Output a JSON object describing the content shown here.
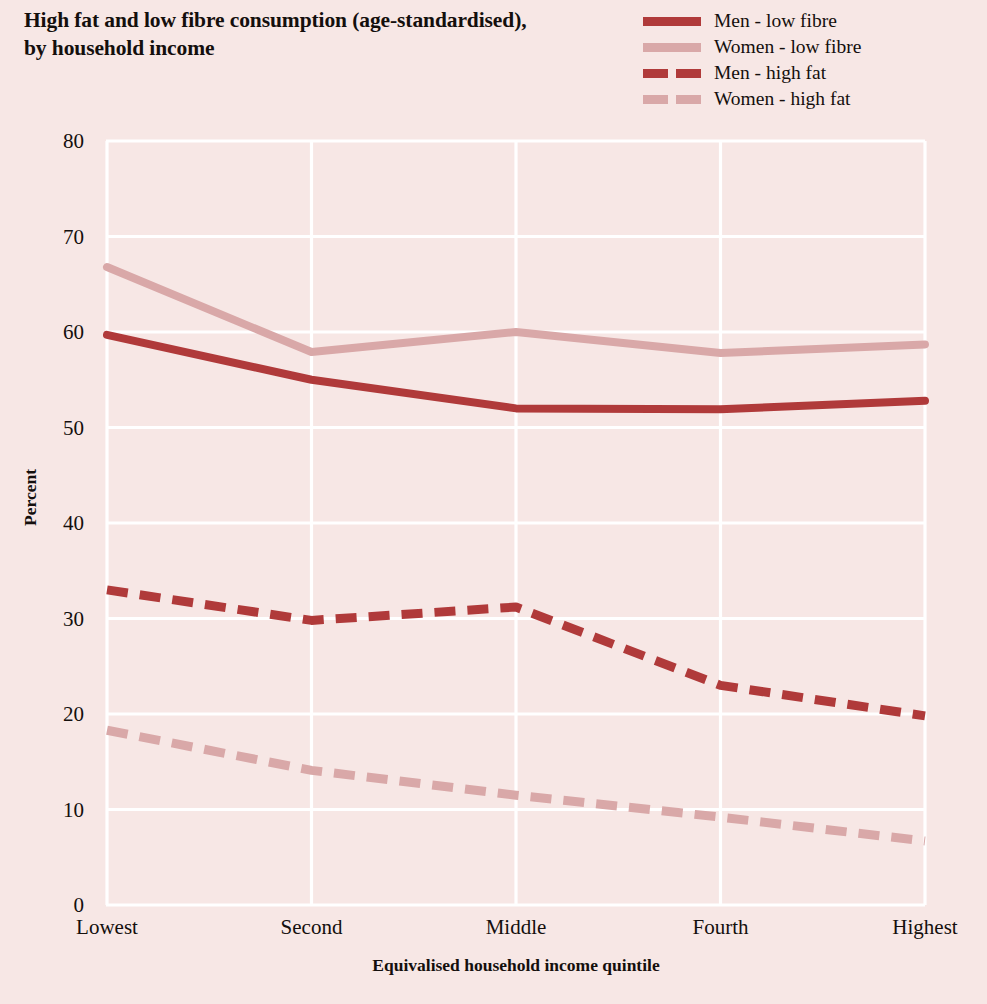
{
  "title": "High fat and low fibre consumption (age-standardised),\nby household income",
  "colors": {
    "background": "#f7e7e5",
    "grid": "#ffffff",
    "men": "#b03a3a",
    "women": "#d9a8a8",
    "text": "#140f0d"
  },
  "legend": {
    "position": "top-right",
    "items": [
      {
        "label": "Men - low fibre",
        "color": "#b03a3a",
        "style": "solid"
      },
      {
        "label": "Women - low fibre",
        "color": "#d9a8a8",
        "style": "solid"
      },
      {
        "label": "Men - high fat",
        "color": "#b03a3a",
        "style": "dashed"
      },
      {
        "label": "Women - high fat",
        "color": "#d9a8a8",
        "style": "dashed"
      }
    ]
  },
  "chart_data": {
    "type": "line",
    "title": "High fat and low fibre consumption (age-standardised), by household income",
    "xlabel": "Equivalised household income quintile",
    "ylabel": "Percent",
    "categories": [
      "Lowest",
      "Second",
      "Middle",
      "Fourth",
      "Highest"
    ],
    "ylim": [
      0,
      80
    ],
    "yticks": [
      0,
      10,
      20,
      30,
      40,
      50,
      60,
      70,
      80
    ],
    "grid": true,
    "series": [
      {
        "name": "Men - low fibre",
        "color": "#b03a3a",
        "style": "solid",
        "values": [
          59.7,
          55.0,
          52.0,
          51.9,
          52.8
        ]
      },
      {
        "name": "Women - low fibre",
        "color": "#d9a8a8",
        "style": "solid",
        "values": [
          66.8,
          57.9,
          60.0,
          57.8,
          58.7
        ]
      },
      {
        "name": "Men - high fat",
        "color": "#b03a3a",
        "style": "dashed",
        "values": [
          33.0,
          29.8,
          31.2,
          23.0,
          19.8
        ]
      },
      {
        "name": "Women - high fat",
        "color": "#d9a8a8",
        "style": "dashed",
        "values": [
          18.3,
          14.1,
          11.5,
          9.2,
          6.7
        ]
      }
    ]
  }
}
